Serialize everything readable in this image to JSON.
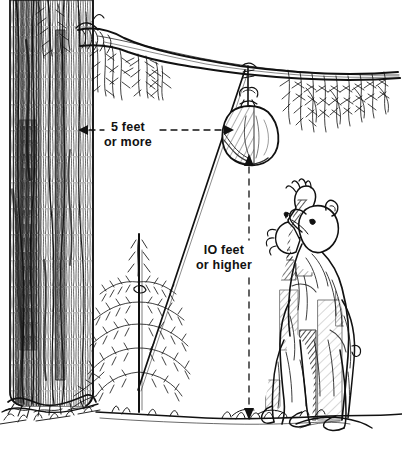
{
  "illustration": {
    "title": "Bear-bagging food hang diagram",
    "type": "pen-and-ink line drawing",
    "background_color": "#ffffff",
    "ink_color": "#111111"
  },
  "annotations": {
    "horizontal": {
      "name": "trunk-to-bag-clearance",
      "line1": "5 feet",
      "line2": "or more",
      "arrow_style": "double-headed dashed",
      "from": "tree-trunk",
      "to": "hanging-rope"
    },
    "vertical": {
      "name": "bag-height-above-ground",
      "line1": "IO feet",
      "line2": "or higher",
      "arrow_style": "double-headed dashed",
      "from": "food-bag",
      "to": "ground"
    }
  },
  "scene_objects": {
    "tree": "large conifer trunk with furrowed bark",
    "branch": "horizontal limb with pine needle sprays",
    "bag": "cinched food sack suspended from branch",
    "rope": "line running from bag down-left to sapling",
    "sapling": "young conifer used as tie-off point",
    "bear": "black bear standing upright reaching up",
    "ground": "ground line with grass tufts"
  }
}
